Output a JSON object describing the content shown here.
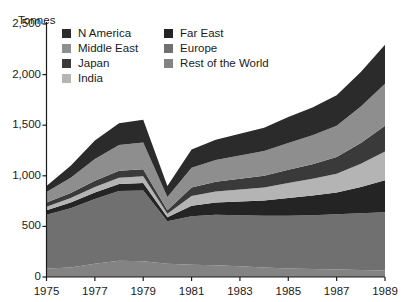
{
  "title_faint": "",
  "axis": {
    "unit_label": "Tonnes",
    "y_ticks": [
      "0",
      "500",
      "1,000",
      "1,500",
      "2,000",
      "2,500"
    ],
    "y_values": [
      0,
      500,
      1000,
      1500,
      2000,
      2500
    ],
    "x_ticks": [
      "1975",
      "1977",
      "1979",
      "1981",
      "1983",
      "1985",
      "1987",
      "1989"
    ],
    "x_tick_values": [
      1975,
      1977,
      1979,
      1981,
      1983,
      1985,
      1987,
      1989
    ]
  },
  "legend": {
    "columns": [
      [
        {
          "label": "N America",
          "color": "#2b2b2b"
        },
        {
          "label": "Middle East",
          "color": "#8e8e8e"
        },
        {
          "label": "Japan",
          "color": "#3a3a3a"
        },
        {
          "label": "India",
          "color": "#b4b4b4"
        }
      ],
      [
        {
          "label": "Far East",
          "color": "#242424"
        },
        {
          "label": "Europe",
          "color": "#707070"
        },
        {
          "label": "Rest of the World",
          "color": "#838383"
        }
      ]
    ]
  },
  "chart_data": {
    "type": "area",
    "title": "",
    "subtitle": "",
    "xlabel": "",
    "ylabel": "Tonnes",
    "xlim": [
      1975,
      1989
    ],
    "ylim": [
      0,
      2500
    ],
    "grid": false,
    "legend_position": "top-inside",
    "stacked": true,
    "stack_order_bottom_to_top": [
      "Rest of the World",
      "Europe",
      "Far East",
      "India",
      "Japan",
      "Middle East",
      "N America"
    ],
    "x": [
      1975,
      1976,
      1977,
      1978,
      1979,
      1980,
      1981,
      1982,
      1983,
      1984,
      1985,
      1986,
      1987,
      1988,
      1989
    ],
    "series": [
      {
        "name": "Rest of the World",
        "color": "#838383",
        "values": [
          85,
          95,
          130,
          160,
          155,
          130,
          120,
          115,
          105,
          95,
          85,
          80,
          75,
          70,
          65
        ]
      },
      {
        "name": "Europe",
        "color": "#707070",
        "values": [
          530,
          585,
          640,
          690,
          700,
          420,
          480,
          500,
          505,
          510,
          520,
          530,
          545,
          560,
          575
        ]
      },
      {
        "name": "Far East",
        "color": "#242424",
        "values": [
          45,
          55,
          65,
          70,
          75,
          40,
          105,
          120,
          135,
          150,
          175,
          195,
          215,
          260,
          315
        ]
      },
      {
        "name": "India",
        "color": "#b4b4b4",
        "values": [
          35,
          45,
          55,
          60,
          65,
          35,
          95,
          110,
          120,
          130,
          150,
          165,
          185,
          230,
          285
        ]
      },
      {
        "name": "Japan",
        "color": "#3a3a3a",
        "values": [
          40,
          50,
          60,
          70,
          70,
          35,
          85,
          95,
          105,
          115,
          130,
          145,
          165,
          205,
          255
        ]
      },
      {
        "name": "Middle East",
        "color": "#8e8e8e",
        "values": [
          105,
          150,
          215,
          255,
          265,
          130,
          195,
          215,
          230,
          245,
          265,
          285,
          310,
          360,
          415
        ]
      },
      {
        "name": "N America",
        "color": "#2b2b2b",
        "values": [
          60,
          120,
          185,
          215,
          225,
          110,
          180,
          200,
          215,
          230,
          255,
          275,
          300,
          340,
          385
        ]
      }
    ],
    "totals": [
      900,
      1100,
      1350,
      1520,
      1555,
      900,
      1260,
      1355,
      1415,
      1475,
      1580,
      1675,
      1795,
      2025,
      2295
    ]
  }
}
